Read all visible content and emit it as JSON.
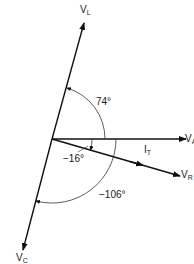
{
  "diagram": {
    "type": "phasor-diagram",
    "phasors": [
      {
        "id": "VL",
        "label": "V",
        "sub": "L",
        "angle_deg": 74
      },
      {
        "id": "VA",
        "label": "V",
        "sub": "A",
        "angle_deg": 0
      },
      {
        "id": "VR",
        "label": "V",
        "sub": "R",
        "angle_deg": -16
      },
      {
        "id": "VC",
        "label": "V",
        "sub": "C",
        "angle_deg": -106
      }
    ],
    "current": {
      "label": "I",
      "sub": "T"
    },
    "angles": [
      {
        "id": "a74",
        "text": "74°"
      },
      {
        "id": "a16",
        "text": "−16°"
      },
      {
        "id": "a106",
        "text": "−106°"
      }
    ]
  }
}
